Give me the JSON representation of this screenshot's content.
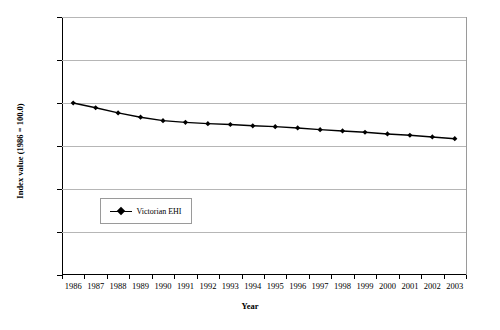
{
  "chart_data": {
    "type": "line",
    "title": "",
    "xlabel": "Year",
    "ylabel": "Index value (1986 = 100.0)",
    "ylim": [
      96.0,
      102.0
    ],
    "ytick_labels": [
      "102.0",
      "101.0",
      "100.0",
      "99.0",
      "98.0",
      "97.0",
      "96.0"
    ],
    "ytick_values": [
      102.0,
      101.0,
      100.0,
      99.0,
      98.0,
      97.0,
      96.0
    ],
    "grid": "horizontal",
    "legend_position": "inside-lower-left",
    "categories": [
      "1986",
      "1987",
      "1988",
      "1989",
      "1990",
      "1991",
      "1992",
      "1993",
      "1994",
      "1995",
      "1996",
      "1997",
      "1998",
      "1999",
      "2000",
      "2001",
      "2002",
      "2003"
    ],
    "series": [
      {
        "name": "Victorian EHI",
        "color": "#000000",
        "marker": "diamond",
        "values": [
          100.0,
          99.89,
          99.77,
          99.67,
          99.59,
          99.55,
          99.52,
          99.5,
          99.47,
          99.45,
          99.42,
          99.38,
          99.35,
          99.32,
          99.28,
          99.25,
          99.21,
          99.17
        ]
      }
    ]
  },
  "legend": {
    "entries": [
      {
        "label": "Victorian EHI"
      }
    ]
  }
}
